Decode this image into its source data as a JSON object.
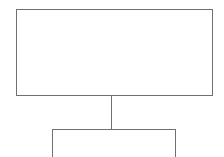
{
  "diagram": {
    "type": "hierarchy",
    "clipped_header_text": "",
    "nodes": [
      {
        "id": "top-box",
        "label": ""
      },
      {
        "id": "bottom-box",
        "label": ""
      }
    ],
    "edges": [
      {
        "from": "top-box",
        "to": "bottom-box"
      }
    ],
    "colors": {
      "stroke": "#707070",
      "background": "#ffffff"
    }
  }
}
